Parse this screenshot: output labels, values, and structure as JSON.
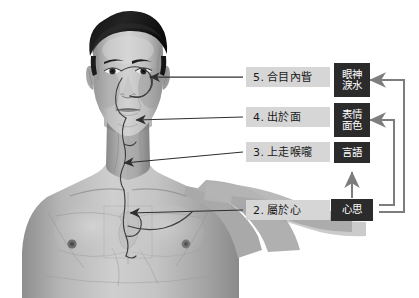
{
  "diagram": {
    "background_color": "#ffffff",
    "label_box_color": "#d6d6d6",
    "term_box_color": "#2b2b2b",
    "connector_color": "#808080",
    "leader_color": "#3a3a3a",
    "meridian_color": "#4a4a4a"
  },
  "pathway_labels": [
    {
      "number": "5.",
      "text": "合目內眥"
    },
    {
      "number": "4.",
      "text": "出於面"
    },
    {
      "number": "3.",
      "text": "上走喉嚨"
    },
    {
      "number": "2.",
      "text": "屬於心"
    }
  ],
  "manifestation_terms": [
    {
      "line1": "眼神",
      "line2": "淚水"
    },
    {
      "line1": "表情",
      "line2": "面色"
    },
    {
      "line1": "言語",
      "line2": ""
    },
    {
      "line1": "心思",
      "line2": ""
    }
  ],
  "figure": {
    "alt": "grayscale anatomical illustration of a male head and torso"
  }
}
